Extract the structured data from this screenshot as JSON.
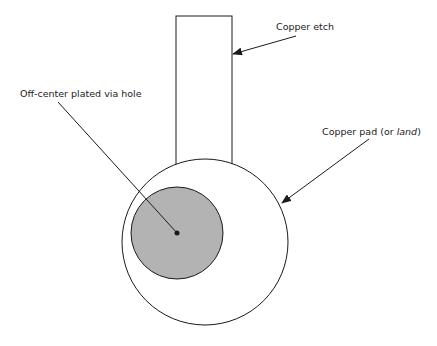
{
  "diagram": {
    "labels": {
      "etch": "Copper etch",
      "via": "Off-center plated via hole",
      "pad_main": "Copper pad (or ",
      "pad_italic": "land",
      "pad_close": ")"
    },
    "colors": {
      "stroke": "#1a1a1a",
      "via_fill": "#b3b3b3",
      "background": "#ffffff"
    }
  }
}
